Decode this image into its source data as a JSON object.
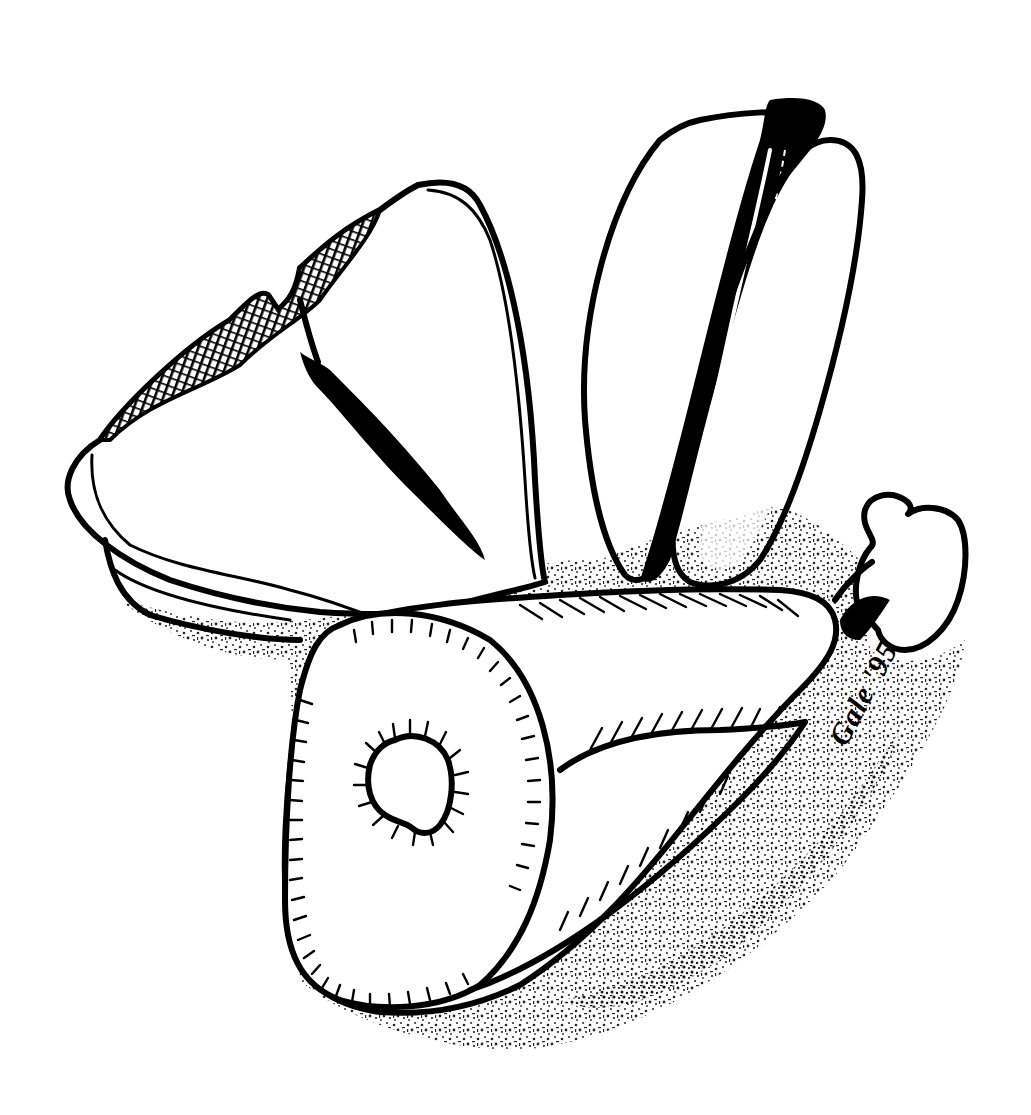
{
  "illustration": {
    "subject": "Pen and ink drawing of meat cuts: a ham shank, a T-bone steak and pork chops",
    "style": "black ink line drawing with stippled shading",
    "colors": {
      "ink": "#000000",
      "paper": "#ffffff"
    },
    "elements": [
      {
        "name": "t-bone-steak",
        "description": "Large steak with T-shaped bone, upper left"
      },
      {
        "name": "chops",
        "description": "Stacked chops standing upright, upper right"
      },
      {
        "name": "ham-shank",
        "description": "Cut ham/shank with round bone in cross-section, foreground"
      },
      {
        "name": "shank-bone-end",
        "description": "Knuckle bone end at right of ham"
      },
      {
        "name": "ground-shadow",
        "description": "Stippled shadow beneath the cuts"
      }
    ]
  },
  "signature": {
    "text": "Gale '95"
  }
}
